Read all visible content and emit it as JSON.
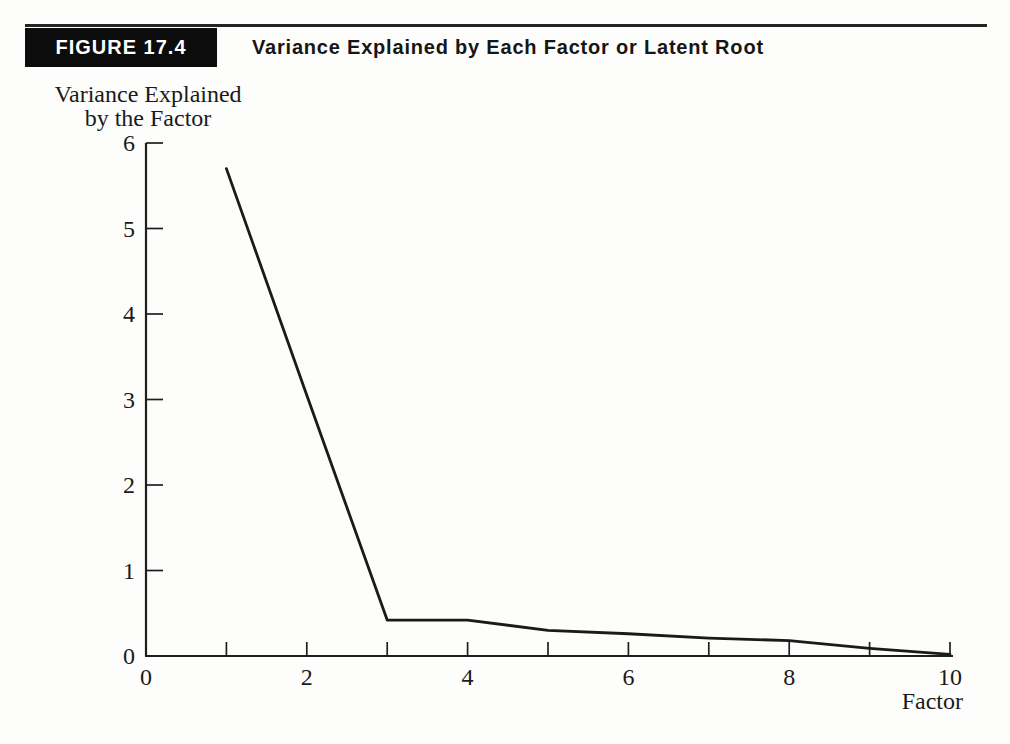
{
  "figure": {
    "label": "FIGURE 17.4",
    "title": "Variance Explained by Each Factor or Latent Root"
  },
  "chart_data": {
    "type": "line",
    "title": "Variance Explained by Each Factor or Latent Root",
    "series_name": "variance-explained-scree",
    "x": [
      1,
      2,
      3,
      4,
      5,
      6,
      7,
      8,
      9,
      10
    ],
    "values": [
      5.7,
      3.05,
      0.42,
      0.42,
      0.3,
      0.26,
      0.21,
      0.18,
      0.09,
      0.02
    ],
    "xlabel": "Factor",
    "ylabel_lines": [
      "Variance Explained",
      "by the Factor"
    ],
    "xlim": [
      0,
      10
    ],
    "ylim": [
      0,
      6
    ],
    "x_ticks": [
      1,
      2,
      3,
      4,
      5,
      6,
      7,
      8,
      9,
      10
    ],
    "x_label_values": [
      0,
      2,
      4,
      6,
      8,
      10
    ],
    "y_ticks": [
      1,
      2,
      3,
      4,
      5,
      6
    ],
    "y_label_values": [
      0,
      1,
      2,
      3,
      4,
      5,
      6
    ],
    "grid": false,
    "legend": "none",
    "line_color": "#1a1a1a",
    "ink_color": "#1e1e1e",
    "background_color": "#fdfdfb"
  }
}
